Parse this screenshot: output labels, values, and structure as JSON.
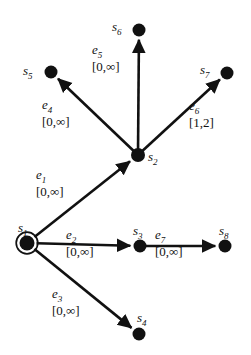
{
  "diagram": {
    "type": "directed-graph",
    "colors": {
      "node": "#111111",
      "edge": "#111111",
      "text": "#111111",
      "background": "#ffffff"
    },
    "infinity_symbol": "∞",
    "nodes": [
      {
        "id": "s1",
        "label": "s",
        "sub": "1",
        "x": 27,
        "y": 243,
        "r": 7.5,
        "initial": true,
        "label_x": 18,
        "label_y": 221
      },
      {
        "id": "s2",
        "label": "s",
        "sub": "2",
        "x": 138,
        "y": 155,
        "r": 7.0,
        "initial": false,
        "label_x": 148,
        "label_y": 150
      },
      {
        "id": "s3",
        "label": "s",
        "sub": "3",
        "x": 140,
        "y": 246,
        "r": 6.5,
        "initial": false,
        "label_x": 133,
        "label_y": 224
      },
      {
        "id": "s4",
        "label": "s",
        "sub": "4",
        "x": 139,
        "y": 334,
        "r": 6.5,
        "initial": false,
        "label_x": 137,
        "label_y": 311
      },
      {
        "id": "s5",
        "label": "s",
        "sub": "5",
        "x": 51,
        "y": 72,
        "r": 6.5,
        "initial": false,
        "label_x": 23,
        "label_y": 64
      },
      {
        "id": "s6",
        "label": "s",
        "sub": "6",
        "x": 139,
        "y": 30,
        "r": 6.5,
        "initial": false,
        "label_x": 112,
        "label_y": 20
      },
      {
        "id": "s7",
        "label": "s",
        "sub": "7",
        "x": 227,
        "y": 73,
        "r": 6.5,
        "initial": false,
        "label_x": 200,
        "label_y": 63
      },
      {
        "id": "s8",
        "label": "s",
        "sub": "8",
        "x": 225,
        "y": 246,
        "r": 6.5,
        "initial": false,
        "label_x": 219,
        "label_y": 224
      }
    ],
    "edges": [
      {
        "id": "e1",
        "label": "e",
        "sub": "1",
        "interval": "[0,∞]",
        "from": "s1",
        "to": "s2",
        "label_x": 36,
        "label_y": 168
      },
      {
        "id": "e2",
        "label": "e",
        "sub": "2",
        "interval": "[0,∞]",
        "from": "s1",
        "to": "s3",
        "label_x": 66,
        "label_y": 228
      },
      {
        "id": "e3",
        "label": "e",
        "sub": "3",
        "interval": "[0,∞]",
        "from": "s1",
        "to": "s4",
        "label_x": 52,
        "label_y": 287
      },
      {
        "id": "e4",
        "label": "e",
        "sub": "4",
        "interval": "[0,∞]",
        "from": "s2",
        "to": "s5",
        "label_x": 42,
        "label_y": 98
      },
      {
        "id": "e5",
        "label": "e",
        "sub": "5",
        "interval": "[0,∞]",
        "from": "s2",
        "to": "s6",
        "label_x": 92,
        "label_y": 43
      },
      {
        "id": "e6",
        "label": "e",
        "sub": "6",
        "interval": "[1,2]",
        "from": "s2",
        "to": "s7",
        "label_x": 189,
        "label_y": 99
      },
      {
        "id": "e7",
        "label": "e",
        "sub": "7",
        "interval": "[0,∞]",
        "from": "s3",
        "to": "s8",
        "label_x": 155,
        "label_y": 228
      }
    ]
  }
}
